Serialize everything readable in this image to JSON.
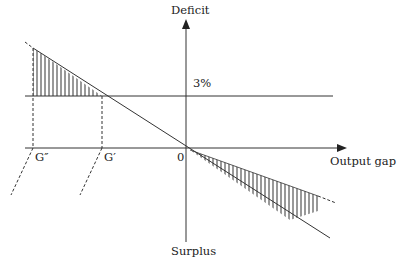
{
  "diagram": {
    "labels": {
      "y_axis_top": "Deficit",
      "y_axis_bottom": "Surplus",
      "x_axis": "Output gap",
      "threshold": "3%",
      "origin": "0",
      "g_prime": "G′",
      "g_double_prime": "G″"
    },
    "colors": {
      "line": "#333333",
      "hatch": "#444444",
      "background": "#ffffff"
    }
  }
}
